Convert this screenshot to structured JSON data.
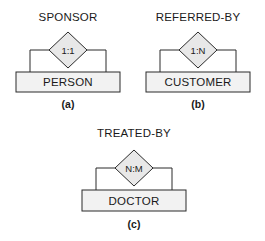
{
  "figure": {
    "colors": {
      "shape_fill": "#e8e8e8",
      "entity_fill": "#f2f2f2",
      "stroke": "#2b2b2b",
      "text": "#1a1a1a",
      "background": "#ffffff"
    },
    "panels": [
      {
        "caption": "(a)",
        "relationship_label": "SPONSOR",
        "cardinality": "1:1",
        "entity_label": "PERSON"
      },
      {
        "caption": "(b)",
        "relationship_label": "REFERRED-BY",
        "cardinality": "1:N",
        "entity_label": "CUSTOMER"
      },
      {
        "caption": "(c)",
        "relationship_label": "TREATED-BY",
        "cardinality": "N:M",
        "entity_label": "DOCTOR"
      }
    ]
  }
}
